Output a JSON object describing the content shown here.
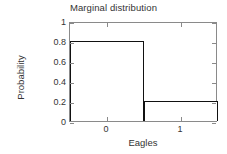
{
  "chart_data": {
    "type": "bar",
    "title": "Marginal distribution",
    "xlabel": "Eagles",
    "ylabel": "Probability",
    "categories": [
      "0",
      "1"
    ],
    "values": [
      0.8,
      0.2
    ],
    "xlim": [
      -0.5,
      1.5
    ],
    "ylim": [
      0,
      1
    ],
    "xticks": [
      0,
      1
    ],
    "xtick_labels": [
      "0",
      "1"
    ],
    "yticks": [
      0,
      0.2,
      0.4,
      0.6,
      0.8,
      1
    ],
    "ytick_labels": [
      "0",
      "0.2",
      "0.4",
      "0.6",
      "0.8",
      "1"
    ],
    "grid": false,
    "legend": null,
    "bar_width": 1.0,
    "bar_fill_color": "#ffffff",
    "bar_edge_color": "#111111",
    "axis_color": "#8a8a8a",
    "background_color": "#ffffff",
    "text_color": "#333333"
  }
}
